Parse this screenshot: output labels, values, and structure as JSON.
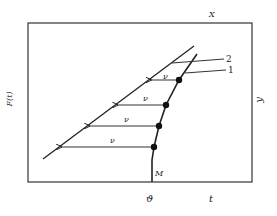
{
  "diagram": {
    "frame": {
      "x": 28,
      "y": 23,
      "w": 224,
      "h": 159
    },
    "axis_labels": {
      "left": "F(t)",
      "right": "y",
      "top": "X",
      "bottom_origin": "ϑ",
      "bottom_right": "t"
    },
    "curve_labels": {
      "line": "2",
      "curve": "1",
      "start": "M"
    },
    "arrow_label": "ν",
    "colors": {
      "stroke": "#222222",
      "background": "#ffffff"
    },
    "line2": {
      "x1": 43,
      "y1": 159,
      "x2": 194,
      "y2": 46
    },
    "curve1_points": [
      [
        152,
        182
      ],
      [
        152,
        160
      ],
      [
        154,
        147
      ],
      [
        159,
        126
      ],
      [
        166,
        105
      ],
      [
        179,
        80
      ],
      [
        197,
        54
      ]
    ],
    "points": [
      {
        "x": 154,
        "y": 147,
        "label": "ν"
      },
      {
        "x": 159,
        "y": 126,
        "label": "ν"
      },
      {
        "x": 166,
        "y": 105,
        "label": "ν"
      },
      {
        "x": 179,
        "y": 80,
        "label": "ν"
      }
    ]
  }
}
